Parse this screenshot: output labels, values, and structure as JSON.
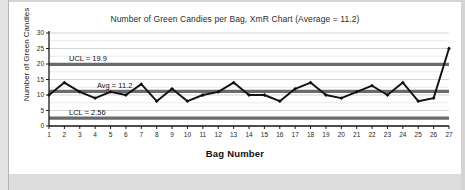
{
  "chart_data": {
    "type": "line",
    "title": "Number of Green Candies per Bag, XmR Chart (Average = 11.2)",
    "xlabel": "Bag Number",
    "ylabel": "Number of Green Candies",
    "categories": [
      1,
      2,
      3,
      4,
      5,
      6,
      7,
      8,
      9,
      10,
      11,
      12,
      13,
      14,
      15,
      16,
      17,
      18,
      19,
      20,
      21,
      22,
      23,
      24,
      25,
      26,
      27
    ],
    "x_tick_labels": [
      "1",
      "2",
      "3",
      "4",
      "5",
      "6",
      "7",
      "8",
      "9",
      "10",
      "11",
      "12",
      "13",
      "14",
      "15",
      "16",
      "17",
      "18",
      "19",
      "20",
      "21",
      "22",
      "23",
      "24",
      "25",
      "26",
      "27"
    ],
    "y_tick_labels": [
      "0",
      "5",
      "10",
      "15",
      "20",
      "25",
      "30"
    ],
    "y_ticks": [
      0,
      5,
      10,
      15,
      20,
      25,
      30
    ],
    "ylim": [
      0,
      30
    ],
    "xlim": [
      1,
      27
    ],
    "grid": true,
    "legend": "none",
    "series": [
      {
        "name": "Number of Green Candies",
        "values": [
          10,
          14,
          11,
          9,
          11,
          10,
          13.5,
          8,
          12,
          8,
          10,
          11,
          14,
          10,
          10,
          8,
          12,
          14,
          10,
          9,
          11,
          13,
          10,
          14,
          8,
          9,
          25
        ],
        "color": "#111111",
        "marker": "diamond"
      }
    ],
    "control_lines": [
      {
        "name": "UCL",
        "label": "UCL = 19.9",
        "value": 19.9,
        "color": "#6b6b6b"
      },
      {
        "name": "Avg",
        "label": "Avg = 11.2",
        "value": 11.2,
        "color": "#6b6b6b"
      },
      {
        "name": "LCL",
        "label": "LCL = 2.56",
        "value": 2.56,
        "color": "#6b6b6b"
      }
    ],
    "gridline_color": "#d0d0d0",
    "axis_color": "#1a1a1a",
    "plot_background": "#ffffff"
  }
}
